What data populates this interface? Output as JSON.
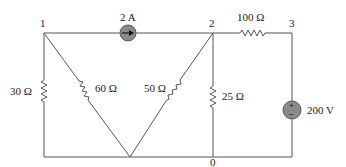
{
  "diagram": {
    "type": "electric-circuit",
    "nodes": [
      {
        "id": "1",
        "label": "1"
      },
      {
        "id": "2",
        "label": "2"
      },
      {
        "id": "3",
        "label": "3"
      },
      {
        "id": "0",
        "label": "0"
      }
    ],
    "components": {
      "current_source": {
        "label": "2 A",
        "from": "1",
        "to": "2",
        "direction": "right"
      },
      "r_100": {
        "label": "100 Ω",
        "from": "2",
        "to": "3"
      },
      "r_30": {
        "label": "30 Ω",
        "from": "1",
        "to": "0"
      },
      "r_60": {
        "label": "60 Ω",
        "from": "1",
        "to": "0"
      },
      "r_50": {
        "label": "50 Ω",
        "from": "2",
        "to": "0"
      },
      "r_25": {
        "label": "25 Ω",
        "from": "2",
        "to": "0"
      },
      "voltage_source": {
        "label": "200 V",
        "plus_node": "3",
        "minus_node": "0",
        "plus_symbol": "+",
        "minus_symbol": "−"
      }
    },
    "colors": {
      "wire": "#555555",
      "source_fill": "#8a8a8a",
      "background": "#ffffff"
    }
  }
}
